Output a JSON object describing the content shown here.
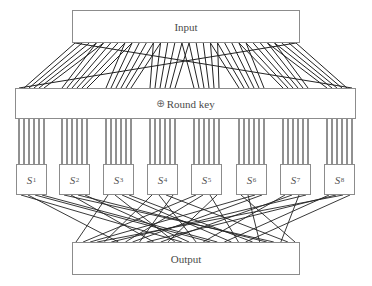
{
  "diagram": {
    "input_label": "Input",
    "roundkey": {
      "symbol": "⊕",
      "label": "Round key"
    },
    "output_label": "Output",
    "sboxes": [
      {
        "letter": "S",
        "index": "1"
      },
      {
        "letter": "S",
        "index": "2"
      },
      {
        "letter": "S",
        "index": "3"
      },
      {
        "letter": "S",
        "index": "4"
      },
      {
        "letter": "S",
        "index": "5"
      },
      {
        "letter": "S",
        "index": "6"
      },
      {
        "letter": "S",
        "index": "7"
      },
      {
        "letter": "S",
        "index": "8"
      }
    ],
    "wiring": {
      "expansion_lines": 48,
      "sbox_inputs_each": 6,
      "sbox_outputs_each": 4,
      "permutation_lines": 32
    },
    "colors": {
      "line": "#222222",
      "box_border": "#8c8c8c",
      "text": "#4a4a4a"
    }
  }
}
